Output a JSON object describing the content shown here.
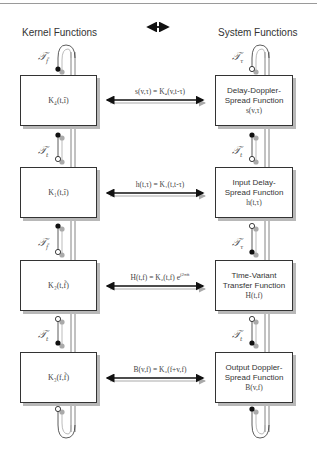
{
  "header": {
    "left_title": "Kernel Functions",
    "center_symbol": "double-arrow",
    "right_title": "System Functions"
  },
  "rows": [
    {
      "kernel": "K₄(t,î)",
      "relation": "s(v,τ) = K₄(v,t-τ)",
      "system_name_line1": "Delay-Doppler-",
      "system_name_line2": "Spread Function",
      "system_symbol": "s(v,τ)"
    },
    {
      "kernel": "K₁(t,î)",
      "relation": "h(t,τ) = K₁(t,t-τ)",
      "system_name_line1": "Input Delay-",
      "system_name_line2": "Spread Function",
      "system_symbol": "h(t,τ)"
    },
    {
      "kernel": "K₂(t,f̃)",
      "relation": "H(t,f) = K₂(t,f) e",
      "relation_sup": "j2πft",
      "system_name_line1": "Time-Variant",
      "system_name_line2": "Transfer Function",
      "system_symbol": "H(t,f)"
    },
    {
      "kernel": "K₃(f,f̃)",
      "relation": "B(v,f) = K₃(f+v,f)",
      "system_name_line1": "Output Doppler-",
      "system_name_line2": "Spread Function",
      "system_symbol": "B(v,f)"
    }
  ],
  "left_operators": [
    {
      "label": "𝒯",
      "sub": "f̃"
    },
    {
      "label": "𝒯",
      "sub": "t"
    },
    {
      "label": "𝒯",
      "sub": "f̃"
    },
    {
      "label": "𝒯",
      "sub": "t"
    }
  ],
  "right_operators": [
    {
      "label": "𝒯",
      "sub": "τ"
    },
    {
      "label": "𝒯",
      "sub": "t"
    },
    {
      "label": "𝒯",
      "sub": "τ"
    },
    {
      "label": "𝒯",
      "sub": "t"
    }
  ],
  "colors": {
    "line": "#222222",
    "shadow": "#b8b8b8",
    "rail": "#555555"
  }
}
